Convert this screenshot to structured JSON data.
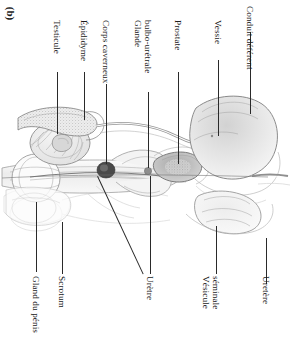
{
  "figure": {
    "panel_label": "(b)",
    "caption_language": "fr",
    "orientation": "rotated-90-clockwise",
    "background_color": "#ffffff",
    "ink_color": "#2a2a2a"
  },
  "labels": {
    "testicule": "Testicule",
    "epididyme": "Épididyme",
    "corps_caverneux": "Corps caverneux",
    "glande_bulbo_uretrale_l1": "Glande",
    "glande_bulbo_uretrale_l2": "bulbo-urétrale",
    "prostate": "Prostate",
    "vessie": "Vessie",
    "conduit_deferent": "Conduit déférent",
    "gland_du_penis": "Gland du pénis",
    "scrotum": "Scrotum",
    "uretre": "Urètre",
    "vesicule_seminale_l1": "Vésicule",
    "vesicule_seminale_l2": "séminale",
    "uretere": "Uretère"
  },
  "structures": {
    "testicle": "testicle-oval-striated",
    "epididymis": "epididymis-stippled-crescent",
    "glans_penis": "glans-penis-circle",
    "corpus_cavernosum_marker": "corpus-cavernosum-dark-dot",
    "bulbourethral_gland_marker": "bulbourethral-gland-small-dot",
    "prostate": "prostate-shaded-mass",
    "bladder": "bladder-large-dome",
    "seminal_vesicle": "seminal-vesicle-lobed",
    "ductus_deferens": "ductus-deferens-tube",
    "urethra": "urethra-channel",
    "ureter": "ureter-tube",
    "scrotum": "scrotum-sac"
  }
}
